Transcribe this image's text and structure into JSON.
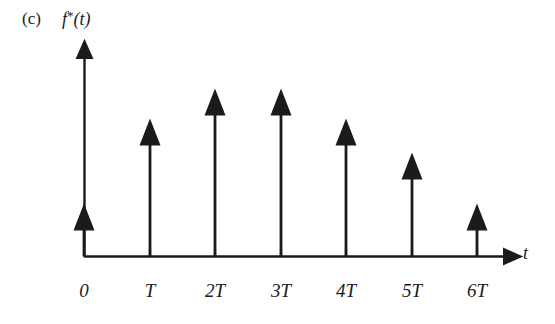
{
  "figure": {
    "panel_label": "(c)",
    "function_symbol": "f",
    "function_star": "*",
    "function_arg": "(t)",
    "x_axis_variable": "t",
    "axis_color": "#1b1b1b",
    "impulse_color": "#1b1b1b",
    "background_color": "#ffffff"
  },
  "chart_data": {
    "type": "bar",
    "title": "f*(t)",
    "subtitle": "(c)",
    "xlabel": "t",
    "ylabel": "f*(t)",
    "categories": [
      "0",
      "T",
      "2T",
      "3T",
      "4T",
      "5T",
      "6T"
    ],
    "values": [
      53,
      138,
      168,
      168,
      138,
      104,
      53
    ],
    "x": [
      0,
      1,
      2,
      3,
      4,
      5,
      6
    ],
    "xlim": [
      0,
      6.55
    ],
    "ylim": [
      0,
      208
    ],
    "grid": false,
    "legend": null
  },
  "ticks": [
    {
      "label": "0",
      "x_px": 84
    },
    {
      "label": "T",
      "x_px": 150
    },
    {
      "label": "2T",
      "x_px": 215
    },
    {
      "label": "3T",
      "x_px": 281
    },
    {
      "label": "4T",
      "x_px": 346
    },
    {
      "label": "5T",
      "x_px": 412
    },
    {
      "label": "6T",
      "x_px": 477
    }
  ]
}
